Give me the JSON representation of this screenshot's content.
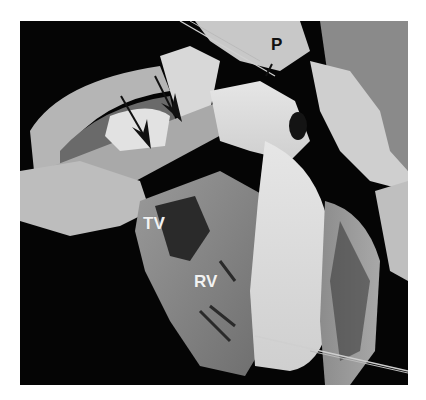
{
  "figure": {
    "labels": {
      "pulmonary": "P",
      "tricuspid_valve": "TV",
      "right_ventricle": "RV"
    },
    "arrows": [
      {
        "name": "arrow-1",
        "points_to": "septal band region (lower)"
      },
      {
        "name": "arrow-2",
        "points_to": "septal band region (upper)"
      }
    ],
    "colors": {
      "background": "#ffffff",
      "photo_background": "#050505",
      "label_dark": "#111111",
      "label_light": "#f2f2f2"
    }
  }
}
